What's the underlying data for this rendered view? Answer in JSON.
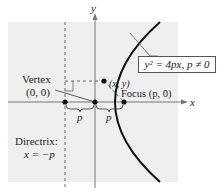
{
  "diagram": {
    "axes": {
      "x_label": "x",
      "y_label": "y"
    },
    "equation": {
      "text": "y² = 4px, p ≠ 0"
    },
    "labels": {
      "vertex_title": "Vertex",
      "vertex_coords": "(0, 0)",
      "point": "(x, y)",
      "focus": "Focus (p, 0)",
      "directrix_title": "Directrix:",
      "directrix_eq": "x = −p",
      "p_left": "p",
      "p_right": "p"
    },
    "colors": {
      "background_panel": "#efefef",
      "curve": "#111111",
      "axes": "#777777",
      "dashed": "#666666"
    }
  }
}
